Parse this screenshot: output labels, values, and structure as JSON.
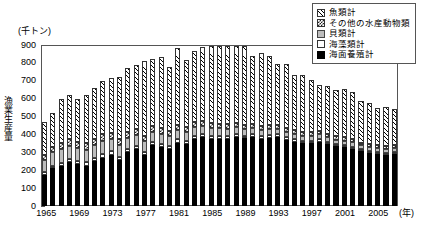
{
  "chart_data": {
    "type": "bar",
    "stacked": true,
    "title": "",
    "unit_label": "(千トン)",
    "ylabel": "漁業生産量",
    "xlabel": "(年)",
    "ylim": [
      0,
      900
    ],
    "yticks": [
      900,
      800,
      700,
      600,
      500,
      400,
      300,
      200,
      100,
      0
    ],
    "grid": false,
    "legend_position": "top-right",
    "categories": [
      "1965",
      "1966",
      "1967",
      "1968",
      "1969",
      "1970",
      "1971",
      "1972",
      "1973",
      "1974",
      "1975",
      "1976",
      "1977",
      "1978",
      "1979",
      "1980",
      "1981",
      "1982",
      "1983",
      "1984",
      "1985",
      "1986",
      "1987",
      "1988",
      "1989",
      "1990",
      "1991",
      "1992",
      "1993",
      "1994",
      "1995",
      "1996",
      "1997",
      "1998",
      "1999",
      "2000",
      "2001",
      "2002",
      "2003",
      "2004",
      "2005",
      "2006",
      "2007"
    ],
    "xtick_labels": [
      "1965",
      "1969",
      "1973",
      "1977",
      "1981",
      "1985",
      "1989",
      "1993",
      "1997",
      "2001",
      "2005"
    ],
    "series": [
      {
        "name": "海面養殖計",
        "pattern": "solid-black",
        "color": "#000000",
        "values": [
          175,
          210,
          225,
          245,
          235,
          225,
          250,
          270,
          285,
          255,
          300,
          320,
          285,
          340,
          330,
          320,
          355,
          345,
          375,
          385,
          395,
          390,
          400,
          400,
          405,
          385,
          375,
          380,
          385,
          370,
          360,
          350,
          350,
          360,
          345,
          335,
          330,
          320,
          305,
          295,
          290,
          285,
          290
        ]
      },
      {
        "name": "海藻類計",
        "pattern": "white",
        "color": "#ffffff",
        "values": [
          15,
          15,
          18,
          18,
          18,
          20,
          20,
          22,
          20,
          20,
          18,
          18,
          18,
          18,
          18,
          18,
          18,
          18,
          18,
          18,
          18,
          18,
          18,
          16,
          16,
          16,
          16,
          16,
          16,
          16,
          14,
          14,
          14,
          14,
          14,
          12,
          12,
          12,
          12,
          12,
          12,
          12,
          12
        ]
      },
      {
        "name": "貝類計",
        "pattern": "gray",
        "color": "#bdbdbd",
        "values": [
          70,
          75,
          78,
          75,
          70,
          70,
          70,
          70,
          68,
          65,
          62,
          60,
          58,
          55,
          55,
          52,
          50,
          50,
          48,
          46,
          44,
          42,
          40,
          38,
          38,
          36,
          34,
          32,
          32,
          30,
          30,
          28,
          28,
          26,
          26,
          24,
          24,
          24,
          22,
          22,
          22,
          22,
          22
        ]
      },
      {
        "name": "その他の水産動物類",
        "pattern": "checker",
        "color": "#ffffff",
        "values": [
          28,
          30,
          32,
          34,
          34,
          36,
          36,
          38,
          36,
          36,
          34,
          34,
          32,
          32,
          32,
          30,
          30,
          30,
          28,
          28,
          28,
          26,
          26,
          26,
          26,
          24,
          24,
          24,
          22,
          22,
          22,
          20,
          20,
          20,
          18,
          18,
          18,
          16,
          16,
          16,
          16,
          16,
          16
        ]
      },
      {
        "name": "魚類計",
        "pattern": "diagonal-hatch",
        "color": "#ffffff",
        "values": [
          182,
          190,
          247,
          248,
          243,
          269,
          284,
          300,
          306,
          344,
          356,
          358,
          417,
          375,
          400,
          355,
          432,
          375,
          400,
          412,
          455,
          450,
          465,
          445,
          470,
          375,
          405,
          385,
          340,
          356,
          305,
          320,
          290,
          255,
          270,
          262,
          268,
          265,
          230,
          230,
          210,
          220,
          200
        ]
      }
    ],
    "legend": [
      {
        "label": "魚類計",
        "pattern": "diagonal-hatch"
      },
      {
        "label": "その他の水産動物類",
        "pattern": "checker"
      },
      {
        "label": "貝類計",
        "pattern": "gray"
      },
      {
        "label": "海藻類計",
        "pattern": "white"
      },
      {
        "label": "海面養殖計",
        "pattern": "solid-black"
      }
    ]
  }
}
